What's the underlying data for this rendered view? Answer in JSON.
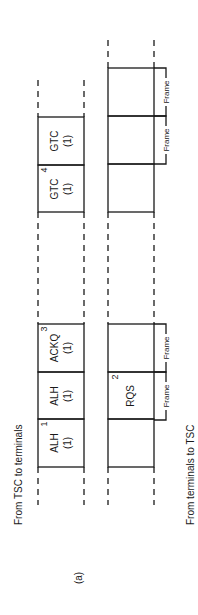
{
  "caption": "(a)",
  "lanes": {
    "downlink": {
      "label": "From TSC to terminals",
      "slots": [
        {
          "name": "GTC",
          "count": "(1)",
          "index": ""
        },
        {
          "name": "GTC",
          "count": "(1)",
          "index": "4"
        },
        {
          "name": "ACKQ",
          "count": "(1)",
          "index": "3"
        },
        {
          "name": "ALH",
          "count": "(1)",
          "index": ""
        },
        {
          "name": "ALH",
          "count": "(1)",
          "index": "1"
        }
      ]
    },
    "uplink": {
      "label": "From terminals to TSC",
      "slots": [
        {
          "name": "",
          "index": ""
        },
        {
          "name": "",
          "index": ""
        },
        {
          "name": "",
          "index": ""
        },
        {
          "name": "",
          "index": ""
        },
        {
          "name": "RQS",
          "index": "2"
        },
        {
          "name": "",
          "index": ""
        }
      ],
      "frame_labels": [
        "Frame",
        "Frame",
        "Frame",
        "Frame"
      ]
    }
  }
}
